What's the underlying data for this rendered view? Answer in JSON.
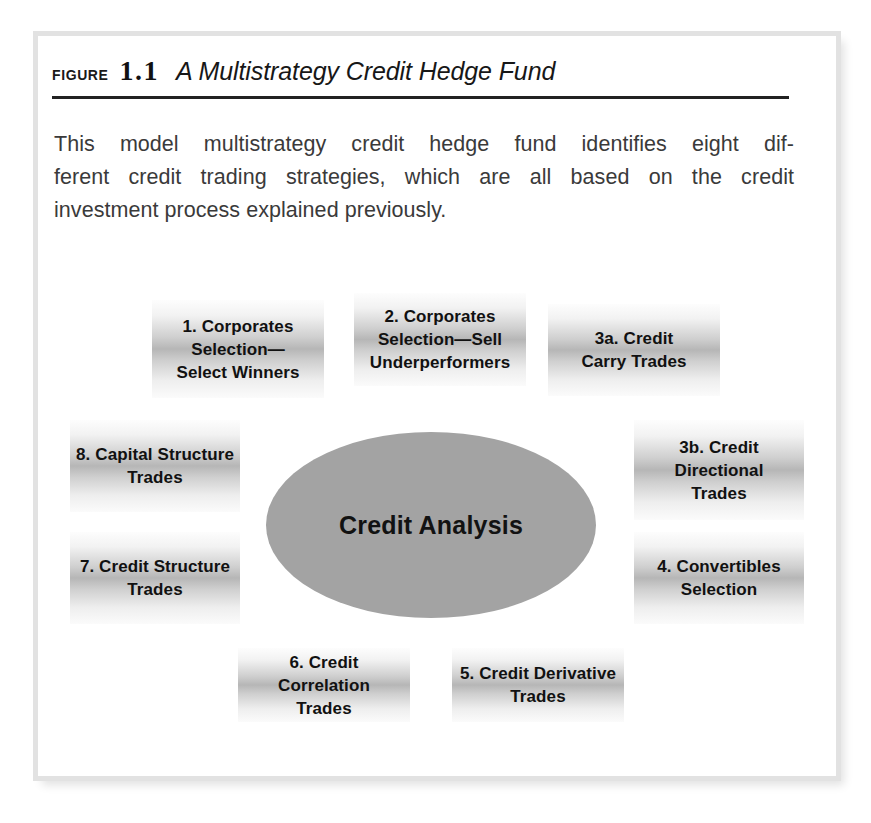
{
  "figure": {
    "label": "Figure",
    "number": "1.1",
    "caption": "A Multistrategy Credit Hedge Fund"
  },
  "intro": {
    "line1": "This model multistrategy credit hedge fund identifies eight dif-",
    "line2": "ferent credit trading strategies, which are all based on the credit",
    "line3": "investment process explained previously."
  },
  "diagram": {
    "center": {
      "label": "Credit Analysis",
      "fill": "#a3a3a3"
    },
    "nodes": [
      {
        "id": "node-1",
        "label": "1. Corporates\nSelection—\nSelect Winners"
      },
      {
        "id": "node-2",
        "label": "2. Corporates\nSelection—Sell\nUnderperformers"
      },
      {
        "id": "node-3a",
        "label": "3a. Credit\nCarry Trades"
      },
      {
        "id": "node-3b",
        "label": "3b. Credit\nDirectional\nTrades"
      },
      {
        "id": "node-4",
        "label": "4. Convertibles\nSelection"
      },
      {
        "id": "node-5",
        "label": "5. Credit Derivative\nTrades"
      },
      {
        "id": "node-6",
        "label": "6. Credit Correlation\nTrades"
      },
      {
        "id": "node-7",
        "label": "7. Credit Structure\nTrades"
      },
      {
        "id": "node-8",
        "label": "8. Capital Structure\nTrades"
      }
    ]
  },
  "colors": {
    "frame_border": "#e2e2e2",
    "rule": "#222222",
    "box_gradient_mid": "#b6b6b6",
    "text": "#111111",
    "body_text": "#3a3a3a"
  }
}
